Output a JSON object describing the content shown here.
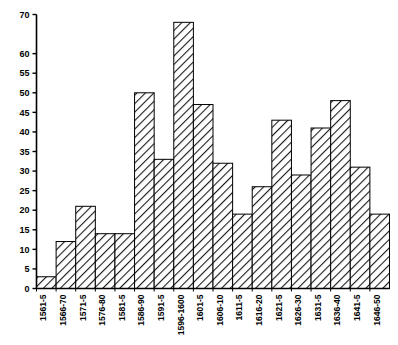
{
  "chart_data": {
    "type": "bar",
    "title": "",
    "subtitle": "",
    "xlabel": "",
    "ylabel": "",
    "categories": [
      "1561-5",
      "1566-70",
      "1571-5",
      "1576-80",
      "1581-5",
      "1586-90",
      "1591-5",
      "1596-1600",
      "1601-5",
      "1606-10",
      "1611-5",
      "1616-20",
      "1621-5",
      "1626-30",
      "1631-5",
      "1636-40",
      "1641-5",
      "1646-50"
    ],
    "values": [
      3,
      12,
      21,
      14,
      14,
      50,
      33,
      68,
      47,
      32,
      19,
      26,
      43,
      29,
      41,
      48,
      31,
      19
    ],
    "ylim": [
      0,
      70
    ],
    "ytick_values": [
      0,
      5,
      10,
      15,
      20,
      25,
      30,
      35,
      40,
      45,
      50,
      55,
      60,
      70
    ],
    "ytick_labels": [
      "0",
      "5",
      "10",
      "15",
      "20",
      "25",
      "30",
      "35",
      "40",
      "45",
      "50",
      "55",
      "60",
      "70"
    ],
    "grid": false,
    "legend": null,
    "legend_position": "none",
    "bar_fill": "hatched-diagonal",
    "bar_edge_color": "#000000",
    "axis_color": "#000000",
    "background_color": "#ffffff",
    "annotations": []
  }
}
